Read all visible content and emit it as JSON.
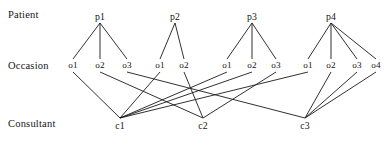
{
  "diagram": {
    "width": 388,
    "height": 142,
    "background_color": "#ffffff",
    "line_color": "#1a1a1a",
    "text_color": "#141414",
    "row_labels": [
      {
        "name": "row-label-patient",
        "text": "Patient",
        "x": 8,
        "y": 9
      },
      {
        "name": "row-label-occasion",
        "text": "Occasion",
        "x": 8,
        "y": 60
      },
      {
        "name": "row-label-consultant",
        "text": "Consultant",
        "x": 8,
        "y": 118
      }
    ],
    "levels": {
      "patient_y": 16,
      "occasion_y": 65,
      "consultant_y": 125
    },
    "patients": [
      {
        "id": "p1",
        "label": "p1",
        "x": 100,
        "y": 16,
        "apex_x": 100,
        "apex_y": 23
      },
      {
        "id": "p2",
        "label": "p2",
        "x": 175,
        "y": 16,
        "apex_x": 175,
        "apex_y": 23
      },
      {
        "id": "p3",
        "label": "p3",
        "x": 252,
        "y": 16,
        "apex_x": 252,
        "apex_y": 23
      },
      {
        "id": "p4",
        "label": "p4",
        "x": 331,
        "y": 16,
        "apex_x": 331,
        "apex_y": 23
      }
    ],
    "occasions": [
      {
        "id": "p1o1",
        "label": "o1",
        "x": 73,
        "y": 65,
        "patient": "p1"
      },
      {
        "id": "p1o2",
        "label": "o2",
        "x": 100,
        "y": 65,
        "patient": "p1"
      },
      {
        "id": "p1o3",
        "label": "o3",
        "x": 127,
        "y": 65,
        "patient": "p1"
      },
      {
        "id": "p2o1",
        "label": "o1",
        "x": 160,
        "y": 65,
        "patient": "p2"
      },
      {
        "id": "p2o2",
        "label": "o2",
        "x": 184,
        "y": 65,
        "patient": "p2"
      },
      {
        "id": "p3o1",
        "label": "o1",
        "x": 227,
        "y": 65,
        "patient": "p3"
      },
      {
        "id": "p3o2",
        "label": "o2",
        "x": 252,
        "y": 65,
        "patient": "p3"
      },
      {
        "id": "p3o3",
        "label": "o3",
        "x": 276,
        "y": 65,
        "patient": "p3"
      },
      {
        "id": "p4o1",
        "label": "o1",
        "x": 308,
        "y": 65,
        "patient": "p4"
      },
      {
        "id": "p4o2",
        "label": "o2",
        "x": 331,
        "y": 65,
        "patient": "p4"
      },
      {
        "id": "p4o3",
        "label": "o3",
        "x": 357,
        "y": 65,
        "patient": "p4"
      },
      {
        "id": "p4o4",
        "label": "o4",
        "x": 376,
        "y": 65,
        "patient": "p4"
      }
    ],
    "consultants": [
      {
        "id": "c1",
        "label": "c1",
        "x": 120,
        "y": 125,
        "apex_x": 120,
        "apex_y": 118
      },
      {
        "id": "c2",
        "label": "c2",
        "x": 203,
        "y": 125,
        "apex_x": 203,
        "apex_y": 118
      },
      {
        "id": "c3",
        "label": "c3",
        "x": 305,
        "y": 125,
        "apex_x": 305,
        "apex_y": 118
      }
    ],
    "patient_edges": [
      {
        "from": "p1",
        "to": "p1o1"
      },
      {
        "from": "p1",
        "to": "p1o2"
      },
      {
        "from": "p1",
        "to": "p1o3"
      },
      {
        "from": "p2",
        "to": "p2o1"
      },
      {
        "from": "p2",
        "to": "p2o2"
      },
      {
        "from": "p3",
        "to": "p3o1"
      },
      {
        "from": "p3",
        "to": "p3o2"
      },
      {
        "from": "p3",
        "to": "p3o3"
      },
      {
        "from": "p4",
        "to": "p4o1"
      },
      {
        "from": "p4",
        "to": "p4o2"
      },
      {
        "from": "p4",
        "to": "p4o3"
      },
      {
        "from": "p4",
        "to": "p4o4"
      }
    ],
    "consultant_edges": [
      {
        "from": "p1o1",
        "to": "c1"
      },
      {
        "from": "p1o2",
        "to": "c2"
      },
      {
        "from": "p1o3",
        "to": "c3"
      },
      {
        "from": "p2o1",
        "to": "c1"
      },
      {
        "from": "p2o2",
        "to": "c2"
      },
      {
        "from": "p3o1",
        "to": "c1"
      },
      {
        "from": "p3o2",
        "to": "c1"
      },
      {
        "from": "p3o3",
        "to": "c2"
      },
      {
        "from": "p4o1",
        "to": "c1"
      },
      {
        "from": "p4o2",
        "to": "c3"
      },
      {
        "from": "p4o3",
        "to": "c3"
      },
      {
        "from": "p4o4",
        "to": "c3"
      }
    ]
  }
}
